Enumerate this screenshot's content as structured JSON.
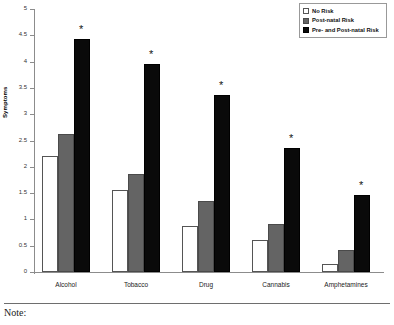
{
  "chart_data": {
    "type": "bar",
    "title": "",
    "xlabel": "",
    "ylabel": "Symptoms",
    "ylim": [
      0,
      5
    ],
    "ytick_values": [
      0,
      0.5,
      1,
      1.5,
      2,
      2.5,
      3,
      3.5,
      4,
      4.5,
      5
    ],
    "ytick_labels": [
      "0",
      "0.5",
      "1",
      "1.5",
      "2",
      "2.5",
      "3",
      "3.5",
      "4",
      "4.5",
      "5"
    ],
    "grid": false,
    "legend_position": "top-right",
    "categories": [
      "Alcohol",
      "Tobacco",
      "Drug",
      "Cannabis",
      "Amphetamines"
    ],
    "series": [
      {
        "name": "No Risk",
        "color": "#ffffff",
        "values": [
          2.2,
          1.55,
          0.87,
          0.6,
          0.15
        ]
      },
      {
        "name": "Post-natal Risk",
        "color": "#646464",
        "values": [
          2.63,
          1.86,
          1.35,
          0.92,
          0.41
        ]
      },
      {
        "name": "Pre- and Post-natal Risk",
        "color": "#0a0a0a",
        "values": [
          4.43,
          3.96,
          3.37,
          2.36,
          1.47
        ]
      }
    ],
    "annotations": [
      {
        "text": "*",
        "category": "Alcohol",
        "series": "Pre- and Post-natal Risk"
      },
      {
        "text": "*",
        "category": "Tobacco",
        "series": "Pre- and Post-natal Risk"
      },
      {
        "text": "*",
        "category": "Drug",
        "series": "Pre- and Post-natal Risk"
      },
      {
        "text": "*",
        "category": "Cannabis",
        "series": "Pre- and Post-natal Risk"
      },
      {
        "text": "*",
        "category": "Amphetamines",
        "series": "Pre- and Post-natal Risk"
      }
    ]
  },
  "legend": {
    "items": [
      {
        "label": "No Risk"
      },
      {
        "label": "Post-natal Risk"
      },
      {
        "label": "Pre- and Post-natal Risk"
      }
    ]
  },
  "footer": {
    "note_label": "Note:"
  }
}
